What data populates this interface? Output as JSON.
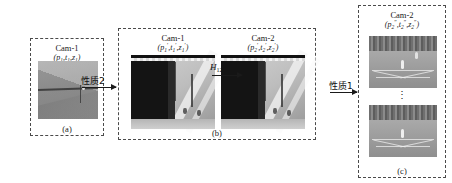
{
  "figure": {
    "type": "pipeline-diagram"
  },
  "panels": [
    {
      "id": "a",
      "caption": "(a)",
      "camera_title": "Cam-1",
      "params": {
        "pan": "p",
        "tilt": "t",
        "zoom": "z",
        "subscript": "1",
        "prime": "",
        "display": "(p1,t1,z1)"
      },
      "image_count": 1,
      "image_alt": "grayscale tennis court view from camera 1"
    },
    {
      "id": "b",
      "caption": "(b)",
      "views": [
        {
          "camera_title": "Cam-1",
          "params": {
            "subscript": "1",
            "prime": "′",
            "display": "(p1′,t1′,z1′)"
          },
          "image_alt": "camera 1 warped view with dark occluded band"
        },
        {
          "camera_title": "Cam-2",
          "params": {
            "subscript": "2",
            "prime": "′",
            "display": "(p2′,t2′,z2′)"
          },
          "image_alt": "camera 2 warped view with dark occluded band"
        }
      ]
    },
    {
      "id": "c",
      "caption": "(c)",
      "camera_title": "Cam-2",
      "params": {
        "subscript": "2",
        "prime": "″",
        "display": "(p2″,t2″,z2″)"
      },
      "image_count": 2,
      "ellipsis": "⋮",
      "image_alt": "two stacked grayscale tennis court frames from camera 2"
    }
  ],
  "arrows": [
    {
      "id": "arrow-1",
      "label": "性质2",
      "from": "a",
      "to": "b"
    },
    {
      "id": "arrow-2",
      "label": "H",
      "subscript": "12",
      "from": "b-left",
      "to": "b-right"
    },
    {
      "id": "arrow-3",
      "label": "性质1",
      "from": "b",
      "to": "c"
    }
  ],
  "colors": {
    "border": "#4a4a4a",
    "text": "#1a1a1a",
    "arrow": "#1a1a1a",
    "background": "#ffffff"
  }
}
